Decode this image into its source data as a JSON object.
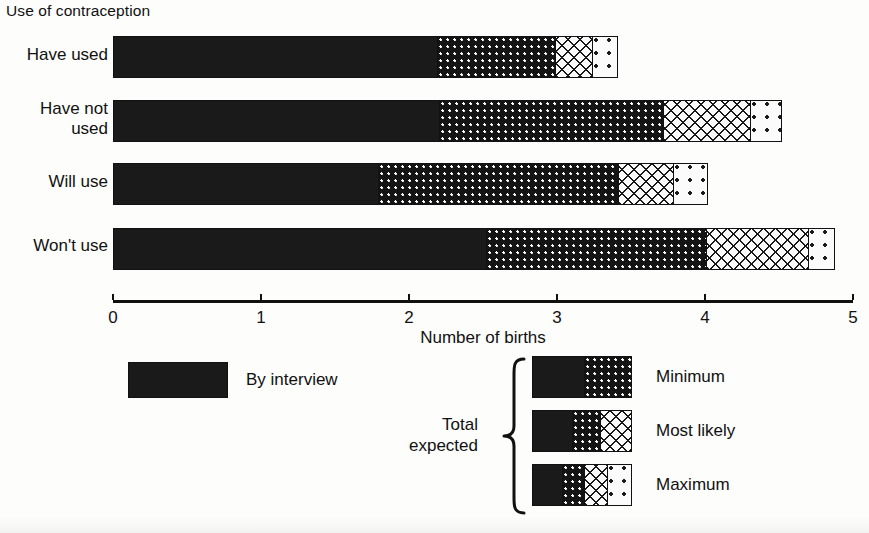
{
  "title": "Use of contraception",
  "axis": {
    "caption": "Number of births",
    "ticks": [
      "0",
      "1",
      "2",
      "3",
      "4",
      "5"
    ],
    "min": 0,
    "max": 5
  },
  "categories": [
    {
      "label": "Have used"
    },
    {
      "label": "Have not\nused"
    },
    {
      "label": "Will use"
    },
    {
      "label": "Won't use"
    }
  ],
  "legend": {
    "by_interview": "By interview",
    "group_label": "Total\nexpected",
    "rows": [
      {
        "label": "Minimum"
      },
      {
        "label": "Most likely"
      },
      {
        "label": "Maximum"
      }
    ]
  },
  "colors": {
    "solid": "#1a1a1a",
    "dense_dots": "#141414",
    "crosshatch": "#fafafa",
    "sparse_dots": "#fbfbfb",
    "axis": "#111111",
    "background": "#fdfdfb"
  },
  "chart_data": {
    "type": "bar",
    "orientation": "horizontal",
    "stacked": true,
    "title": "Use of contraception",
    "xlabel": "Number of births",
    "ylabel": "",
    "xlim": [
      0,
      5
    ],
    "xticks": [
      0,
      1,
      2,
      3,
      4,
      5
    ],
    "grid": false,
    "legend_position": "bottom",
    "categories": [
      "Have used",
      "Have not used",
      "Will use",
      "Won't use"
    ],
    "series": [
      {
        "name": "By interview",
        "pattern": "solid",
        "values": [
          2.19,
          2.2,
          1.79,
          2.52
        ]
      },
      {
        "name": "Minimum",
        "pattern": "dense-dots",
        "cumulative_values": [
          2.99,
          3.72,
          3.42,
          4.01
        ],
        "values": [
          0.8,
          1.52,
          1.63,
          1.49
        ]
      },
      {
        "name": "Most likely",
        "pattern": "crosshatch",
        "cumulative_values": [
          3.24,
          4.31,
          3.79,
          4.7
        ],
        "values": [
          0.25,
          0.59,
          0.37,
          0.69
        ]
      },
      {
        "name": "Maximum",
        "pattern": "sparse-dots",
        "cumulative_values": [
          3.41,
          4.52,
          4.02,
          4.88
        ],
        "values": [
          0.17,
          0.21,
          0.23,
          0.18
        ]
      }
    ],
    "bars": [
      {
        "category": "Have used",
        "by_interview": 2.19,
        "minimum": 2.99,
        "most_likely": 3.24,
        "maximum": 3.41
      },
      {
        "category": "Have not used",
        "by_interview": 2.2,
        "minimum": 3.72,
        "most_likely": 4.31,
        "maximum": 4.52
      },
      {
        "category": "Will use",
        "by_interview": 1.79,
        "minimum": 3.42,
        "most_likely": 3.79,
        "maximum": 4.02
      },
      {
        "category": "Won't use",
        "by_interview": 2.52,
        "minimum": 4.01,
        "most_likely": 4.7,
        "maximum": 4.88
      }
    ]
  }
}
